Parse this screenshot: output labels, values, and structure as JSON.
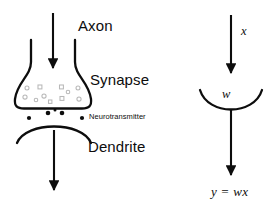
{
  "diagram": {
    "background_color": "#ffffff",
    "ink_color": "#0d0d0d",
    "vesicle_color": "#b8b8b8"
  },
  "biological": {
    "labels": {
      "axon": "Axon",
      "synapse": "Synapse",
      "neurotransmitter": "Neurotransmitter",
      "dendrite": "Dendrite"
    },
    "vesicle_count": 11,
    "neurotransmitter_dot_count": 5
  },
  "mathematical": {
    "input_label": "x",
    "weight_label": "w",
    "output_equation": "y = wx"
  }
}
